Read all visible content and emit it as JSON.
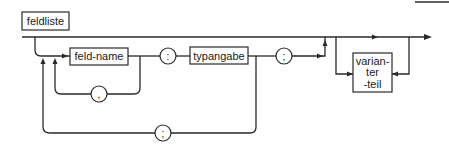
{
  "diagram": {
    "type": "syntax-diagram",
    "title": "feldliste",
    "nodes": {
      "field_name": "feld-name",
      "colon": ":",
      "type_spec": "typangabe",
      "semicolon_main": ";",
      "comma_loop": ",",
      "semicolon_loop": ";",
      "variant_part_line1": "varian-",
      "variant_part_line2": "ter",
      "variant_part_line3": "-teil"
    },
    "colors": {
      "stroke": "#2a2a2a",
      "text": "#1a1a1a",
      "background": "#ffffff"
    }
  }
}
